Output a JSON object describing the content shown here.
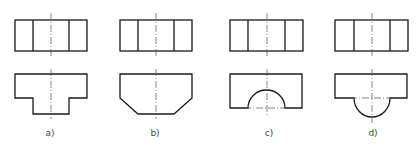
{
  "figure": {
    "panels": [
      {
        "id": "a",
        "label": "a)",
        "cx": 51,
        "shape": "T-shaped front view (stepped bottom)"
      },
      {
        "id": "b",
        "label": "b)",
        "cx": 156,
        "shape": "chamfered bottom corners"
      },
      {
        "id": "c",
        "label": "c)",
        "cx": 267,
        "shape": "semicircular arch cut-out at bottom"
      },
      {
        "id": "d",
        "label": "d)",
        "cx": 372,
        "shape": "semicircular boss protruding below"
      }
    ],
    "top_view": "rectangle divided into three vertical sections",
    "colors": {
      "line": "#1a1a1a",
      "centerline": "#555555",
      "label": "#444444"
    }
  }
}
